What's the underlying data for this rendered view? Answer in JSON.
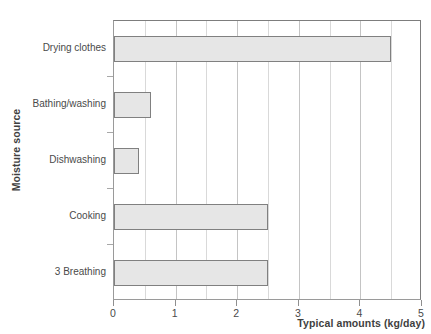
{
  "chart_data": {
    "type": "bar",
    "orientation": "horizontal",
    "title": "",
    "xlabel": "Typical amounts (kg/day)",
    "ylabel": "Moisture source",
    "categories": [
      "Drying clothes",
      "Bathing/washing",
      "Dishwashing",
      "Cooking",
      "3 Breathing"
    ],
    "values": [
      4.5,
      0.6,
      0.4,
      2.5,
      2.5
    ],
    "xlim": [
      0,
      5
    ],
    "xticks": [
      "0",
      "1",
      "2",
      "3",
      "4",
      "5"
    ],
    "xtick_values": [
      0,
      1,
      2,
      3,
      4,
      5
    ],
    "minor_gridlines": [
      0.5,
      1.5,
      2.5,
      3.5,
      4.5
    ],
    "grid": true,
    "legend": "none",
    "bar_fill_color": "#e6e6e6",
    "bar_border_color": "#808080",
    "gridline_color": "#c4c4c4",
    "axis_color": "#8f8f8f",
    "text_color": "#4a4a4a"
  }
}
